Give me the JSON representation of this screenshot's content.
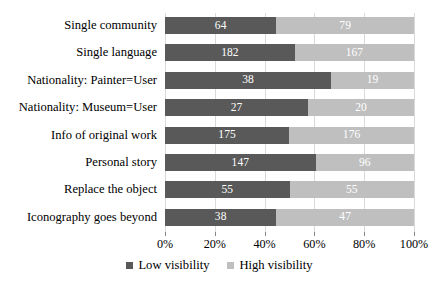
{
  "chart_data": {
    "type": "bar",
    "subtype": "stacked-horizontal-100percent",
    "title": "",
    "xlabel": "",
    "ylabel": "",
    "categories": [
      "Single community",
      "Single language",
      "Nationality: Painter=User",
      "Nationality: Museum=User",
      "Info of original work",
      "Personal story",
      "Replace the object",
      "Iconography goes beyond"
    ],
    "series": [
      {
        "name": "Low visibility",
        "color": "#595959",
        "values": [
          64,
          182,
          38,
          27,
          175,
          147,
          55,
          38
        ]
      },
      {
        "name": "High visibility",
        "color": "#bfbfbf",
        "values": [
          79,
          167,
          19,
          20,
          176,
          96,
          55,
          47
        ]
      }
    ],
    "xticks": [
      "0%",
      "20%",
      "40%",
      "60%",
      "80%",
      "100%"
    ],
    "xlim": [
      0,
      100
    ],
    "grid": true,
    "legend_position": "bottom"
  },
  "legend": {
    "items": [
      {
        "label": "Low visibility",
        "swatch": "low"
      },
      {
        "label": "High visibility",
        "swatch": "high"
      }
    ]
  },
  "colors": {
    "low_visibility": "#595959",
    "high_visibility": "#bfbfbf",
    "gridline": "#d9d9d9",
    "axis": "#868686",
    "data_label": "#ffffff"
  }
}
